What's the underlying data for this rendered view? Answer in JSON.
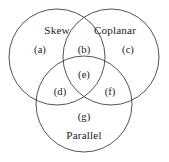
{
  "diagram": {
    "type": "venn-3-set",
    "title": "",
    "canvas": {
      "width": 169,
      "height": 162,
      "background": "#ffffff"
    },
    "stroke_color": "#3f3f44",
    "text_color": "#1d1d20",
    "sets": [
      {
        "id": "skew",
        "label": "Skew",
        "label_x": 57,
        "label_y": 31,
        "cx": 57,
        "cy": 57,
        "r": 48
      },
      {
        "id": "coplanar",
        "label": "Coplanar",
        "label_x": 115,
        "label_y": 31,
        "cx": 111,
        "cy": 57,
        "r": 48
      },
      {
        "id": "parallel",
        "label": "Parallel",
        "label_x": 84,
        "label_y": 136,
        "cx": 84,
        "cy": 104,
        "r": 48
      }
    ],
    "regions": [
      {
        "id": "a",
        "label": "(a)",
        "x": 40,
        "y": 51,
        "membership": "skew-only"
      },
      {
        "id": "b",
        "label": "(b)",
        "x": 84,
        "y": 51,
        "membership": "skew-and-coplanar"
      },
      {
        "id": "c",
        "label": "(c)",
        "x": 128,
        "y": 51,
        "membership": "coplanar-only"
      },
      {
        "id": "d",
        "label": "(d)",
        "x": 60,
        "y": 93,
        "membership": "skew-and-parallel"
      },
      {
        "id": "e",
        "label": "(e)",
        "x": 84,
        "y": 76,
        "membership": "all-three"
      },
      {
        "id": "f",
        "label": "(f)",
        "x": 110,
        "y": 93,
        "membership": "coplanar-and-parallel"
      },
      {
        "id": "g",
        "label": "(g)",
        "x": 84,
        "y": 118,
        "membership": "parallel-only"
      }
    ]
  }
}
